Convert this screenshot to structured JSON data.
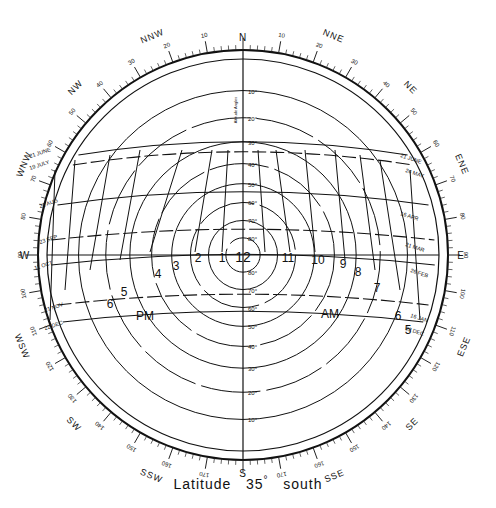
{
  "diagram": {
    "type": "sun-path",
    "caption_prefix": "Latitude",
    "caption_value": "35",
    "caption_degree": "°",
    "caption_suffix": "south",
    "center": [
      243,
      255
    ],
    "outer_radius": 205,
    "compass_points": [
      {
        "label": "N",
        "az": 0
      },
      {
        "label": "NNE",
        "az": 22.5
      },
      {
        "label": "NE",
        "az": 45
      },
      {
        "label": "ENE",
        "az": 67.5
      },
      {
        "label": "E",
        "az": 90
      },
      {
        "label": "ESE",
        "az": 112.5
      },
      {
        "label": "SE",
        "az": 135
      },
      {
        "label": "SSE",
        "az": 157.5
      },
      {
        "label": "S",
        "az": 180
      },
      {
        "label": "SSW",
        "az": 202.5
      },
      {
        "label": "SW",
        "az": 225
      },
      {
        "label": "WSW",
        "az": 247.5
      },
      {
        "label": "W",
        "az": 270
      },
      {
        "label": "WNW",
        "az": 292.5
      },
      {
        "label": "NW",
        "az": 315
      },
      {
        "label": "NNW",
        "az": 337.5
      }
    ],
    "bearing_labels": [
      "0",
      "10",
      "20",
      "30",
      "40",
      "50",
      "60",
      "70",
      "80",
      "90",
      "100",
      "110",
      "120",
      "130",
      "140",
      "150",
      "160",
      "170",
      "180"
    ],
    "altitude_axis_label": "Altitude Angles",
    "altitude_labels_north": [
      "10°",
      "20°",
      "30°",
      "40°",
      "50°",
      "60°",
      "70°",
      "80°"
    ],
    "altitude_labels_south": [
      "80°",
      "70°",
      "60°",
      "50°",
      "40°",
      "30°",
      "20°",
      "10°"
    ],
    "date_lines": [
      {
        "label": "21 JUNE",
        "side": "W"
      },
      {
        "label": "19 JULY",
        "side": "W"
      },
      {
        "label": "21 AUG",
        "side": "W"
      },
      {
        "label": "23 SEP",
        "side": "W"
      },
      {
        "label": "11 OCT",
        "side": "W"
      },
      {
        "label": "21 NOV",
        "side": "W"
      },
      {
        "label": "22 DEC",
        "side": "W"
      },
      {
        "label": "21 JUNE",
        "side": "E"
      },
      {
        "label": "24 MAY",
        "side": "E"
      },
      {
        "label": "16 APR",
        "side": "E"
      },
      {
        "label": "21 MAR",
        "side": "E"
      },
      {
        "label": "26 FEB",
        "side": "E"
      },
      {
        "label": "16 JAN",
        "side": "E"
      },
      {
        "label": "22 DEC",
        "side": "E"
      }
    ],
    "hour_labels": [
      "12",
      "1",
      "2",
      "3",
      "4",
      "5",
      "6",
      "11",
      "10",
      "9",
      "8",
      "7",
      "6",
      "5"
    ],
    "pm_label": "PM",
    "am_label": "AM"
  },
  "chart_data": {
    "type": "sun-path",
    "altitude_rings_deg": [
      10,
      20,
      30,
      40,
      50,
      60,
      70,
      80
    ],
    "azimuth_range": [
      0,
      360
    ],
    "hours": [
      5,
      6,
      7,
      8,
      9,
      10,
      11,
      12,
      1,
      2,
      3,
      4,
      5,
      6
    ],
    "dates": [
      "21 JUNE",
      "19 JULY / 24 MAY",
      "21 AUG / 16 APR",
      "23 SEP / 21 MAR",
      "11 OCT / 26 FEB",
      "21 NOV / 16 JAN",
      "22 DEC"
    ]
  }
}
